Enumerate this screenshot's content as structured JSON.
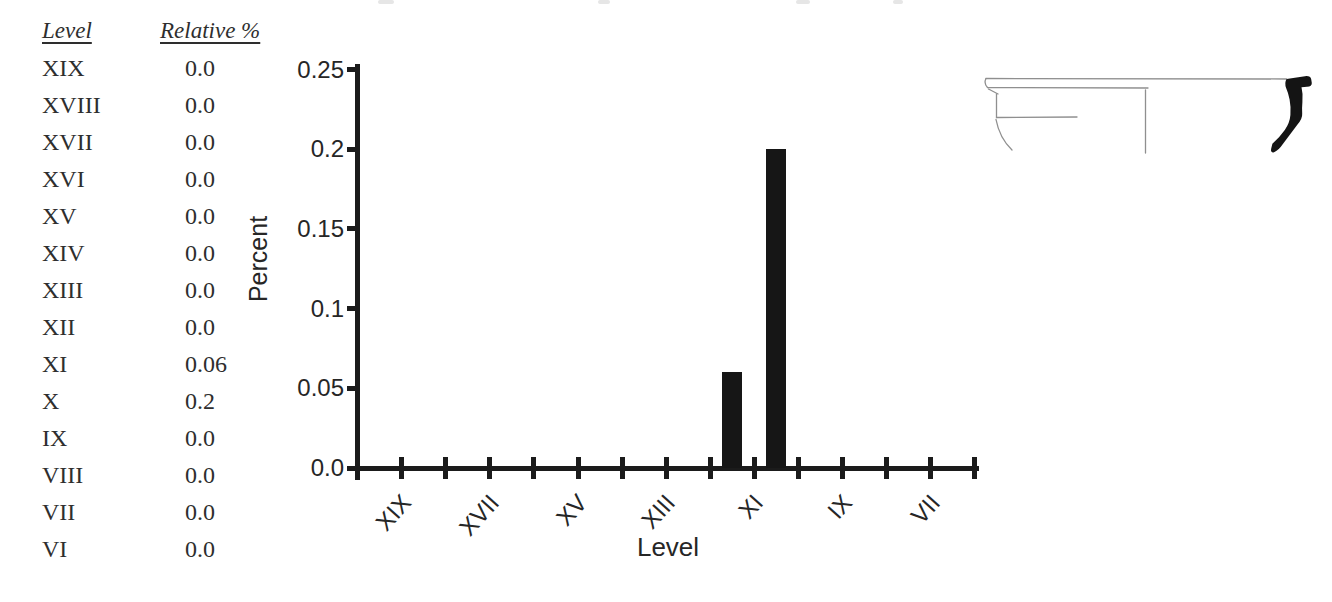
{
  "page": {
    "background": "#ffffff"
  },
  "table": {
    "headers": [
      "Level",
      "Relative %"
    ],
    "rows": [
      {
        "level": "XIX",
        "value": "0.0"
      },
      {
        "level": "XVIII",
        "value": "0.0"
      },
      {
        "level": "XVII",
        "value": "0.0"
      },
      {
        "level": "XVI",
        "value": "0.0"
      },
      {
        "level": "XV",
        "value": "0.0"
      },
      {
        "level": "XIV",
        "value": "0.0"
      },
      {
        "level": "XIII",
        "value": "0.0"
      },
      {
        "level": "XII",
        "value": "0.0"
      },
      {
        "level": "XI",
        "value": "0.06"
      },
      {
        "level": "X",
        "value": "0.2"
      },
      {
        "level": "IX",
        "value": "0.0"
      },
      {
        "level": "VIII",
        "value": "0.0"
      },
      {
        "level": "VII",
        "value": "0.0"
      },
      {
        "level": "VI",
        "value": "0.0"
      }
    ]
  },
  "chart_data": {
    "type": "bar",
    "title": "",
    "categories": [
      "XIX",
      "XVIII",
      "XVII",
      "XVI",
      "XV",
      "XIV",
      "XIII",
      "XII",
      "XI",
      "X",
      "IX",
      "VIII",
      "VII",
      "VI"
    ],
    "values": [
      0,
      0,
      0,
      0,
      0,
      0,
      0,
      0,
      0.06,
      0.2,
      0,
      0,
      0,
      0
    ],
    "xlabel": "Level",
    "ylabel": "Percent",
    "ylim": [
      0,
      0.25
    ],
    "yticks": [
      0,
      0.05,
      0.1,
      0.15,
      0.2,
      0.25
    ],
    "ytick_labels": [
      "0.0",
      "0.05",
      "0.1",
      "0.15",
      "0.2",
      "0.25"
    ],
    "xtick_labeled_categories": [
      "XIX",
      "XVII",
      "XV",
      "XIII",
      "XI",
      "IX",
      "VII"
    ],
    "bar_color": "#161616",
    "axis_color": "#1b1b1b",
    "grid": false,
    "legend": null
  },
  "figures": {
    "rim_profile_icon": "ceramic-rim-profile-drawing"
  }
}
